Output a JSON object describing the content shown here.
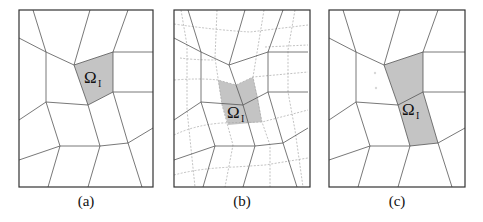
{
  "figure": {
    "panels": [
      {
        "id": "a",
        "caption": "(a)",
        "region_label": "Ω",
        "region_subscript": "I",
        "refined": false
      },
      {
        "id": "b",
        "caption": "(b)",
        "region_label": "Ω",
        "region_subscript": "I",
        "refined": true
      },
      {
        "id": "c",
        "caption": "(c)",
        "region_label": "Ω",
        "region_subscript": "I",
        "refined": false
      }
    ]
  },
  "colors": {
    "border": "#333333",
    "mesh_line": "#555555",
    "refine_line": "#a8a8a8",
    "shade": "#c4c4c4"
  }
}
